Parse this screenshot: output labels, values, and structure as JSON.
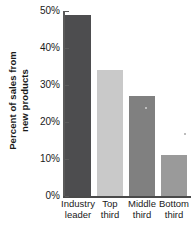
{
  "chart_data": {
    "type": "bar",
    "title": "",
    "subtitle": "",
    "xlabel": "",
    "ylabel": "Percent of sales from new products",
    "ylabel_lines": [
      "Percent of sales from",
      "new products"
    ],
    "categories": [
      "Industry leader",
      "Top third",
      "Middle third",
      "Bottom third"
    ],
    "category_lines": [
      [
        "Industry",
        "leader"
      ],
      [
        "Top",
        "third"
      ],
      [
        "Middle",
        "third"
      ],
      [
        "Bottom",
        "third"
      ]
    ],
    "values": [
      49,
      34,
      27,
      11
    ],
    "value_labels": [
      "49%",
      "34%",
      "27%",
      "11%"
    ],
    "unit": "%",
    "ylim": [
      0,
      50
    ],
    "ytick_values": [
      0,
      10,
      20,
      30,
      40,
      50
    ],
    "ytick_labels": [
      "0%",
      "10%",
      "20%",
      "30%",
      "40%",
      "50%"
    ],
    "grid": false,
    "legend": false,
    "legend_position": "none",
    "bar_colors": [
      "#4d4d4f",
      "#c9c9c9",
      "#808080",
      "#9a9a9a"
    ],
    "axis_color": "#4a4a4a",
    "background": "#ffffff",
    "text_color": "#1a1a1a"
  },
  "y_ticks": [
    {
      "label": "50%",
      "value": 50
    },
    {
      "label": "40%",
      "value": 40
    },
    {
      "label": "30%",
      "value": 30
    },
    {
      "label": "20%",
      "value": 20
    },
    {
      "label": "10%",
      "value": 10
    },
    {
      "label": "0%",
      "value": 0
    }
  ],
  "bars": [
    {
      "label_line1": "Industry",
      "label_line2": "leader",
      "value": 49,
      "color": "#4d4d4f"
    },
    {
      "label_line1": "Top",
      "label_line2": "third",
      "value": 34,
      "color": "#c9c9c9"
    },
    {
      "label_line1": "Middle",
      "label_line2": "third",
      "value": 27,
      "color": "#808080"
    },
    {
      "label_line1": "Bottom",
      "label_line2": "third",
      "value": 11,
      "color": "#9a9a9a"
    }
  ],
  "y_axis_title": {
    "line1": "Percent of sales from",
    "line2": "new products"
  }
}
